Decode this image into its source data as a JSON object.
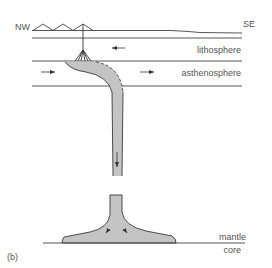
{
  "diagram": {
    "panel_label": "(b)",
    "directions": {
      "left": "NW",
      "right": "SE"
    },
    "layers": {
      "lithosphere": "lithosphere",
      "asthenosphere": "asthenosphere",
      "mantle": "mantle",
      "core": "core"
    },
    "colors": {
      "line": "#333333",
      "slab_fill": "#c4c4c4",
      "slab_stroke": "#3a3a3a",
      "text": "#555555"
    },
    "arrows": [
      {
        "name": "lithosphere-flow-arrow",
        "direction": "left"
      },
      {
        "name": "asthenosphere-flow-arrow-left",
        "direction": "right"
      },
      {
        "name": "asthenosphere-flow-arrow-right",
        "direction": "right"
      },
      {
        "name": "slab-descent-arrow",
        "direction": "down"
      },
      {
        "name": "plume-head-arrow-left",
        "direction": "down-left"
      },
      {
        "name": "plume-head-arrow-right",
        "direction": "down-right"
      }
    ]
  }
}
